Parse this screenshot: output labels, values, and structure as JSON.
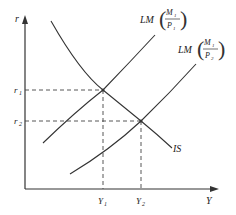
{
  "diagram": {
    "type": "IS-LM",
    "axes": {
      "y_label": "r",
      "x_label": "Y"
    },
    "curves": {
      "is": {
        "label": "IS"
      },
      "lm1": {
        "label_prefix": "LM",
        "numerator": "M",
        "numerator_sub": "1",
        "denominator": "P",
        "denominator_sub": "1"
      },
      "lm2": {
        "label_prefix": "LM",
        "numerator": "M",
        "numerator_sub": "1",
        "denominator": "P",
        "denominator_sub": "2"
      }
    },
    "equilibria": [
      {
        "r_label": "r",
        "r_sub": "1",
        "y_label": "Y",
        "y_sub": "1"
      },
      {
        "r_label": "r",
        "r_sub": "2",
        "y_label": "Y",
        "y_sub": "2"
      }
    ]
  },
  "colors": {
    "line": "#333333",
    "background": "#ffffff"
  }
}
